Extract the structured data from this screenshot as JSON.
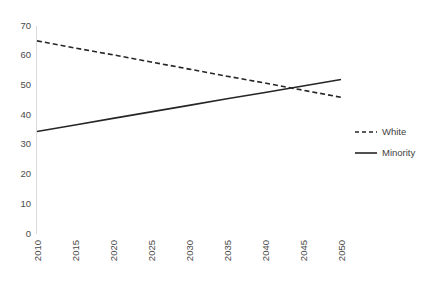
{
  "chart_data": {
    "type": "line",
    "title": "",
    "subtitle": "",
    "xlabel": "",
    "ylabel": "",
    "x": [
      2010,
      2015,
      2020,
      2025,
      2030,
      2035,
      2040,
      2045,
      2050
    ],
    "categories": [
      "2010",
      "2015",
      "2020",
      "2025",
      "2030",
      "2035",
      "2040",
      "2045",
      "2050"
    ],
    "series": [
      {
        "name": "White",
        "style": "dashed",
        "color": "#262626",
        "values": [
          65,
          62.6,
          60.3,
          57.9,
          55.5,
          53.1,
          50.8,
          48.4,
          46
        ]
      },
      {
        "name": "Minority",
        "style": "solid",
        "color": "#262626",
        "values": [
          34.5,
          36.7,
          38.9,
          41.1,
          43.3,
          45.5,
          47.6,
          49.8,
          52
        ]
      }
    ],
    "ylim": [
      0,
      70
    ],
    "yticks": [
      0,
      10,
      20,
      30,
      40,
      50,
      60,
      70
    ],
    "ytick_labels": [
      "0",
      "10",
      "20",
      "30",
      "40",
      "50",
      "60",
      "70"
    ],
    "xlim": [
      2010,
      2050
    ],
    "xtick_label_rotation": -90,
    "grid": false,
    "legend_position": "right",
    "legend": [
      {
        "label": "White",
        "style": "dashed"
      },
      {
        "label": "Minority",
        "style": "solid"
      }
    ],
    "axis_color": "#d9d9d9",
    "text_color": "#4a4a4a"
  },
  "legend": {
    "white_label": "White",
    "minority_label": "Minority"
  },
  "y_axis": {
    "t0": "0",
    "t1": "10",
    "t2": "20",
    "t3": "30",
    "t4": "40",
    "t5": "50",
    "t6": "60",
    "t7": "70"
  },
  "x_axis": {
    "t0": "2010",
    "t1": "2015",
    "t2": "2020",
    "t3": "2025",
    "t4": "2030",
    "t5": "2035",
    "t6": "2040",
    "t7": "2045",
    "t8": "2050"
  }
}
